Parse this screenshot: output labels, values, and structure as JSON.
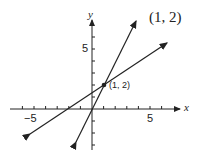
{
  "title_label": "(1, 2)",
  "axes": {
    "x_label": "x",
    "y_label": "y",
    "x_ticks": {
      "neg5": "−5",
      "pos5": "5"
    },
    "y_ticks": {
      "pos5": "5"
    }
  },
  "point": {
    "label": "(1, 2)",
    "x": 1,
    "y": 2
  },
  "lines": [
    {
      "name": "line-steep",
      "equation": "y = 2x"
    },
    {
      "name": "line-shallow",
      "equation": "y = (2x + 4)/3"
    }
  ],
  "colors": {
    "ink": "#222222",
    "background": "#ffffff"
  }
}
